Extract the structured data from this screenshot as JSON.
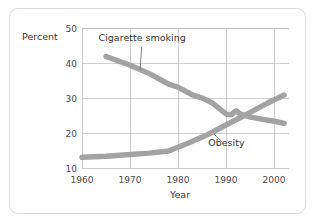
{
  "figure": {
    "background_color": "#ffffff",
    "border_color": "#dcdcdc",
    "line_color": "#a3a3a3",
    "grid_color": "#c9c9c9",
    "text_color": "#343434"
  },
  "chart_data": {
    "type": "line",
    "title": "",
    "subtitle": "",
    "xlabel": "Year",
    "ylabel": "Percent",
    "xlim": [
      1960,
      2003
    ],
    "ylim": [
      10,
      50
    ],
    "xticks": [
      1960,
      1970,
      1980,
      1990,
      2000
    ],
    "xtick_labels": [
      "1960",
      "1970",
      "1980",
      "1990",
      "2000"
    ],
    "yticks": [
      10,
      20,
      30,
      40,
      50
    ],
    "ytick_labels": [
      "10",
      "20",
      "30",
      "40",
      "50"
    ],
    "grid": "both",
    "legend": "inline-annotations",
    "series": [
      {
        "name": "Cigarette smoking",
        "label": "Cigarette smoking",
        "color": "#a3a3a3",
        "x": [
          1965,
          1970,
          1974,
          1978,
          1980,
          1983,
          1985,
          1987,
          1990,
          1991,
          1992,
          1993,
          1995,
          1997,
          2000,
          2002
        ],
        "values": [
          42.0,
          39.5,
          37.1,
          34.1,
          33.2,
          31.0,
          30.1,
          28.8,
          25.5,
          25.4,
          26.5,
          25.5,
          24.7,
          24.2,
          23.5,
          22.9
        ]
      },
      {
        "name": "Obesity",
        "label": "Obesity",
        "color": "#a3a3a3",
        "x": [
          1960,
          1965,
          1970,
          1974,
          1978,
          1982,
          1986,
          1990,
          1993,
          1996,
          1999,
          2002
        ],
        "values": [
          13.2,
          13.5,
          14.0,
          14.4,
          15.0,
          17.2,
          19.6,
          22.5,
          24.6,
          26.8,
          29.0,
          31.0
        ]
      }
    ],
    "annotations": [
      {
        "text": "Cigarette smoking",
        "label_x": 1972.5,
        "label_y": 46.4,
        "points_to_x": 1972.0,
        "points_to_y": 37.4
      },
      {
        "text": "Obesity",
        "label_x": 1990.0,
        "label_y": 16.4,
        "points_to_x": 1987.0,
        "points_to_y": 20.4
      }
    ]
  }
}
